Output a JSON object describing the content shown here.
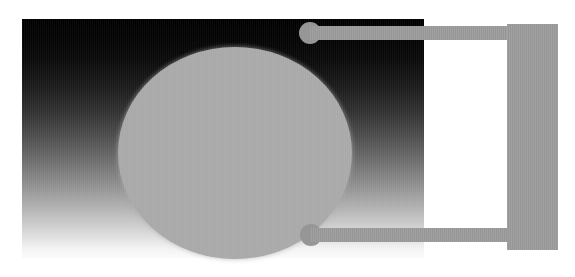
{
  "figure": {
    "caption_top_left": "· ···· ···· ···· ······· ·· ····· ···· ···· ····· ·· ··· ···· ·· ···· ·· ··· ·· ·· ····",
    "caption_top_right": "··· ···· ····· ···· ··· ···· ··· ···· ·· ····· ··· ··· ···· ······ ···· ·· ····· ·· ····",
    "panel_label": "",
    "ellipse_label": "",
    "bar_top_label": "",
    "bar_bottom_label": "",
    "bar_vertical_label": ""
  },
  "colors": {
    "page_background": "#ffffff",
    "panel_gradient_start": "#000000",
    "panel_gradient_end": "#fbfbfb",
    "ellipse_fill": "#a9a9a9",
    "bar_fill": "#969696",
    "caption_text": "#c9c9ce"
  },
  "geometry": {
    "image_width": 575,
    "image_height": 277,
    "panel": {
      "x": 22,
      "y": 19,
      "width": 402,
      "height": 239
    },
    "ellipse": {
      "x": 96,
      "y": 28,
      "width": 234,
      "height": 212
    },
    "bar_top": {
      "x": 310,
      "y": 26,
      "width": 248,
      "height": 14
    },
    "bar_bottom": {
      "x": 311,
      "y": 228,
      "width": 247,
      "height": 14
    },
    "bar_cap_top": {
      "x": 299,
      "y": 22,
      "diameter": 22
    },
    "bar_cap_bottom": {
      "x": 300,
      "y": 224,
      "diameter": 22
    },
    "bar_vertical": {
      "x": 507,
      "y": 24,
      "width": 51,
      "height": 226
    }
  }
}
